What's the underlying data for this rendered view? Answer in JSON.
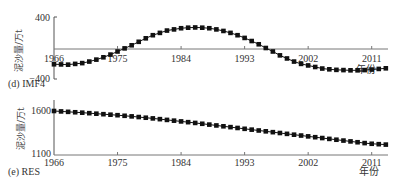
{
  "chart_data": [
    {
      "type": "line",
      "title": "(d) IMF4",
      "xlabel": "年份",
      "ylabel": "泥沙量/万t",
      "ylim": [
        -400,
        400
      ],
      "yticks": [
        "400",
        "-400"
      ],
      "xticks": [
        "1966",
        "1975",
        "1984",
        "1993",
        "2002",
        "2011"
      ],
      "x": [
        1966,
        1967,
        1968,
        1969,
        1970,
        1971,
        1972,
        1973,
        1974,
        1975,
        1976,
        1977,
        1978,
        1979,
        1980,
        1981,
        1982,
        1983,
        1984,
        1985,
        1986,
        1987,
        1988,
        1989,
        1990,
        1991,
        1992,
        1993,
        1994,
        1995,
        1996,
        1997,
        1998,
        1999,
        2000,
        2001,
        2002,
        2003,
        2004,
        2005,
        2006,
        2007,
        2008,
        2009,
        2010,
        2011,
        2012,
        2013
      ],
      "series": [
        {
          "name": "IMF4",
          "values": [
            -210,
            -212,
            -215,
            -205,
            -195,
            -175,
            -150,
            -120,
            -85,
            -45,
            -5,
            35,
            80,
            125,
            165,
            195,
            225,
            240,
            255,
            262,
            265,
            262,
            255,
            240,
            220,
            195,
            165,
            130,
            90,
            48,
            0,
            -45,
            -95,
            -135,
            -175,
            -205,
            -225,
            -245,
            -265,
            -275,
            -282,
            -285,
            -288,
            -288,
            -285,
            -278,
            -270,
            -262
          ]
        }
      ],
      "grid": false,
      "zero_line": true
    },
    {
      "type": "line",
      "title": "(e) RES",
      "xlabel": "年份",
      "ylabel": "泥沙量/万t",
      "ylim": [
        1100,
        1650
      ],
      "yticks": [
        "1600",
        "1100"
      ],
      "xticks": [
        "1966",
        "1975",
        "1984",
        "1993",
        "2002",
        "2011"
      ],
      "x": [
        1966,
        1967,
        1968,
        1969,
        1970,
        1971,
        1972,
        1973,
        1974,
        1975,
        1976,
        1977,
        1978,
        1979,
        1980,
        1981,
        1982,
        1983,
        1984,
        1985,
        1986,
        1987,
        1988,
        1989,
        1990,
        1991,
        1992,
        1993,
        1994,
        1995,
        1996,
        1997,
        1998,
        1999,
        2000,
        2001,
        2002,
        2003,
        2004,
        2005,
        2006,
        2007,
        2008,
        2009,
        2010,
        2011,
        2012,
        2013
      ],
      "series": [
        {
          "name": "RES",
          "values": [
            1600,
            1595,
            1590,
            1585,
            1580,
            1574,
            1568,
            1562,
            1556,
            1550,
            1543,
            1536,
            1528,
            1520,
            1512,
            1503,
            1494,
            1485,
            1476,
            1467,
            1458,
            1448,
            1438,
            1428,
            1418,
            1408,
            1398,
            1388,
            1378,
            1368,
            1358,
            1348,
            1338,
            1328,
            1318,
            1308,
            1298,
            1288,
            1278,
            1268,
            1258,
            1248,
            1238,
            1228,
            1218,
            1210,
            1205,
            1200
          ]
        }
      ],
      "grid": false
    }
  ],
  "labels": {
    "top_title": "(d) IMF4",
    "bottom_title": "(e) RES",
    "ylabel": "泥沙量/万t",
    "xlabel": "年份",
    "top_ymax": "400",
    "top_ymin": "−400",
    "bottom_ymax": "1600",
    "bottom_ymin": "1100",
    "xticks": [
      "1966",
      "1975",
      "1984",
      "1993",
      "2002",
      "2011"
    ]
  }
}
